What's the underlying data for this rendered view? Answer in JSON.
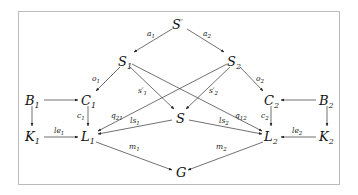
{
  "diagram": {
    "frame": {
      "x": 18,
      "y": 11,
      "w": 322,
      "h": 174,
      "color": "#bbbbbb"
    },
    "nodes": [
      {
        "id": "Sp",
        "base": "S",
        "sup": "′",
        "sub": "",
        "x": 178,
        "y": 25
      },
      {
        "id": "S1",
        "base": "S",
        "sub": "1",
        "x": 125,
        "y": 62
      },
      {
        "id": "S2",
        "base": "S",
        "sub": "2",
        "x": 234,
        "y": 62
      },
      {
        "id": "B1",
        "base": "B",
        "sub": "1",
        "x": 33,
        "y": 101
      },
      {
        "id": "C1",
        "base": "C",
        "sub": "1",
        "x": 88,
        "y": 101
      },
      {
        "id": "C2",
        "base": "C",
        "sub": "2",
        "x": 270,
        "y": 101
      },
      {
        "id": "B2",
        "base": "B",
        "sub": "2",
        "x": 326,
        "y": 101
      },
      {
        "id": "S",
        "base": "S",
        "sub": "",
        "x": 180,
        "y": 119
      },
      {
        "id": "K1",
        "base": "K",
        "sub": "1",
        "x": 33,
        "y": 137
      },
      {
        "id": "L1",
        "base": "L",
        "sub": "1",
        "x": 88,
        "y": 137
      },
      {
        "id": "L2",
        "base": "L",
        "sub": "2",
        "x": 270,
        "y": 137
      },
      {
        "id": "K2",
        "base": "K",
        "sub": "2",
        "x": 326,
        "y": 137
      },
      {
        "id": "G",
        "base": "G",
        "sub": "",
        "x": 180,
        "y": 173
      }
    ],
    "edges": [
      {
        "from": "Sp",
        "to": "S1",
        "label": "a1"
      },
      {
        "from": "Sp",
        "to": "S2",
        "label": "a2"
      },
      {
        "from": "S1",
        "to": "C1",
        "label": "o1"
      },
      {
        "from": "S2",
        "to": "C2",
        "label": "o2"
      },
      {
        "from": "S1",
        "to": "S",
        "label": "s'1"
      },
      {
        "from": "S2",
        "to": "S",
        "label": "s'2"
      },
      {
        "from": "S1",
        "to": "L2",
        "label": "q12"
      },
      {
        "from": "S2",
        "to": "L1",
        "label": "q21"
      },
      {
        "from": "S",
        "to": "L1",
        "label": "ls1"
      },
      {
        "from": "S",
        "to": "L2",
        "label": "ls2"
      },
      {
        "from": "B1",
        "to": "C1",
        "label": ""
      },
      {
        "from": "B1",
        "to": "K1",
        "label": ""
      },
      {
        "from": "C1",
        "to": "L1",
        "label": "c1"
      },
      {
        "from": "K1",
        "to": "L1",
        "label": "le1"
      },
      {
        "from": "B2",
        "to": "C2",
        "label": ""
      },
      {
        "from": "B2",
        "to": "K2",
        "label": ""
      },
      {
        "from": "C2",
        "to": "L2",
        "label": "c2"
      },
      {
        "from": "K2",
        "to": "L2",
        "label": "le2"
      },
      {
        "from": "L1",
        "to": "G",
        "label": "m1"
      },
      {
        "from": "L2",
        "to": "G",
        "label": "m2"
      }
    ]
  },
  "labels": {
    "a1": {
      "base": "a",
      "sub": "1"
    },
    "a2": {
      "base": "a",
      "sub": "2"
    },
    "o1": {
      "base": "o",
      "sub": "1"
    },
    "o2": {
      "base": "o",
      "sub": "2"
    },
    "s1p": {
      "base": "s′",
      "sub": "1"
    },
    "s2p": {
      "base": "s′",
      "sub": "2"
    },
    "q21": {
      "base": "q",
      "sub": "21"
    },
    "q12": {
      "base": "q",
      "sub": "12"
    },
    "ls1": {
      "base": "ls",
      "sub": "1"
    },
    "ls2": {
      "base": "ls",
      "sub": "2"
    },
    "c1": {
      "base": "c",
      "sub": "1"
    },
    "c2": {
      "base": "c",
      "sub": "2"
    },
    "le1": {
      "base": "le",
      "sub": "1"
    },
    "le2": {
      "base": "le",
      "sub": "2"
    },
    "m1": {
      "base": "m",
      "sub": "1"
    },
    "m2": {
      "base": "m",
      "sub": "2"
    }
  },
  "nodes": {
    "Sp": {
      "base": "S",
      "sup": "′"
    },
    "S1": {
      "base": "S",
      "sub": "1"
    },
    "S2": {
      "base": "S",
      "sub": "2"
    },
    "B1": {
      "base": "B",
      "sub": "1"
    },
    "C1": {
      "base": "C",
      "sub": "1"
    },
    "C2": {
      "base": "C",
      "sub": "2"
    },
    "B2": {
      "base": "B",
      "sub": "2"
    },
    "S": {
      "base": "S"
    },
    "K1": {
      "base": "K",
      "sub": "1"
    },
    "L1": {
      "base": "L",
      "sub": "1"
    },
    "L2": {
      "base": "L",
      "sub": "2"
    },
    "K2": {
      "base": "K",
      "sub": "2"
    },
    "G": {
      "base": "G"
    }
  }
}
